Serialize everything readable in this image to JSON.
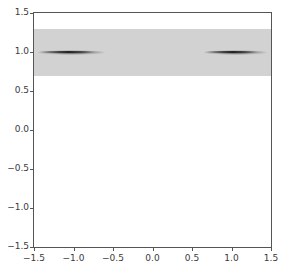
{
  "chart_data": {
    "type": "heatmap",
    "title": "",
    "xlabel": "",
    "ylabel": "",
    "xlim": [
      -1.5,
      1.5
    ],
    "ylim": [
      -1.5,
      1.5
    ],
    "grid": false,
    "legend": false,
    "background_color": "#ffffff",
    "band_color": "#d2d2d2",
    "streak_color": "#282828",
    "axis_color": "#555555",
    "tick_label_color": "#3a3a3a",
    "xticks": [
      -1.5,
      -1.0,
      -0.5,
      0.0,
      0.5,
      1.0,
      1.5
    ],
    "xticklabels": [
      "-1.5",
      "-1.0",
      "-0.5",
      "0.0",
      "0.5",
      "1.0",
      "1.5"
    ],
    "yticks": [
      -1.5,
      -1.0,
      -0.5,
      0.0,
      0.5,
      1.0,
      1.5
    ],
    "yticklabels": [
      "-1.5",
      "-1.0",
      "-0.5",
      "0.0",
      "0.5",
      "1.0",
      "1.5"
    ],
    "shaded_band": {
      "description": "uniform light-gray density band spanning full x range",
      "y_min": 0.69,
      "y_max": 1.3,
      "x_min": -1.5,
      "x_max": 1.5,
      "value": 0.18
    },
    "features": [
      {
        "name": "left-streak",
        "center_x": -1.0,
        "center_y": 1.0,
        "x_min": -1.45,
        "x_max": -0.6,
        "peak_value": 1.0
      },
      {
        "name": "right-streak",
        "center_x": 1.05,
        "center_y": 1.0,
        "x_min": 0.65,
        "x_max": 1.45,
        "peak_value": 1.0
      }
    ]
  }
}
